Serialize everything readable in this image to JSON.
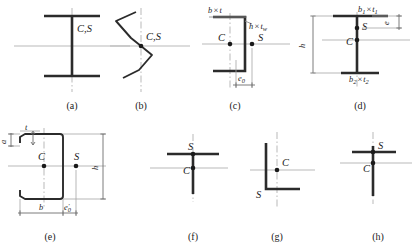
{
  "figure": {
    "point_labels": {
      "centroid": "C",
      "shear_centre": "S",
      "combined": "C,S"
    },
    "symbols": {
      "multiply": "×",
      "prime": "′"
    }
  },
  "panels": [
    {
      "id": "a",
      "caption": "(a)",
      "shape": "doubly-symmetric-i-section",
      "points": [
        {
          "name": "combined",
          "label": "C,S",
          "label_text": "C,S"
        }
      ],
      "dimensions": []
    },
    {
      "id": "b",
      "caption": "(b)",
      "shape": "z-section",
      "points": [
        {
          "name": "combined",
          "label": "C,S",
          "label_text": "C,S"
        }
      ],
      "dimensions": []
    },
    {
      "id": "c",
      "caption": "(c)",
      "shape": "channel-section",
      "points": [
        {
          "name": "centroid",
          "label": "C"
        },
        {
          "name": "shear-centre",
          "label": "S"
        }
      ],
      "dimensions": [
        {
          "name": "flange",
          "base": "b",
          "sep": "×",
          "second": "t",
          "second_sub": ""
        },
        {
          "name": "web",
          "base": "h",
          "sep": "×",
          "second": "t",
          "second_sub": "w"
        },
        {
          "name": "eccentricity",
          "base": "e",
          "base_sub": "0",
          "prime": false
        }
      ]
    },
    {
      "id": "d",
      "caption": "(d)",
      "shape": "mono-symmetric-i-section",
      "points": [
        {
          "name": "shear-centre",
          "label": "S"
        },
        {
          "name": "centroid",
          "label": "C"
        }
      ],
      "dimensions": [
        {
          "name": "top-flange",
          "base": "b",
          "base_sub": "1",
          "sep": "×",
          "second": "t",
          "second_sub": "1"
        },
        {
          "name": "bottom-flange",
          "base": "b",
          "base_sub": "2",
          "sep": "×",
          "second": "t",
          "second_sub": "2"
        },
        {
          "name": "height",
          "base": "h"
        },
        {
          "name": "shear-offset",
          "base": "e",
          "base_sub": ""
        }
      ]
    },
    {
      "id": "e",
      "caption": "(e)",
      "shape": "lipped-channel-section",
      "points": [
        {
          "name": "centroid",
          "label": "C"
        },
        {
          "name": "shear-centre",
          "label": "S"
        }
      ],
      "dimensions": [
        {
          "name": "thickness",
          "base": "t"
        },
        {
          "name": "lip",
          "base": "a"
        },
        {
          "name": "height",
          "base": "h"
        },
        {
          "name": "width",
          "base": "b"
        },
        {
          "name": "eccentricity",
          "base": "e",
          "base_sub": "0",
          "prime": true
        }
      ]
    },
    {
      "id": "f",
      "caption": "(f)",
      "shape": "tee-section",
      "points": [
        {
          "name": "shear-centre",
          "label": "S"
        },
        {
          "name": "centroid",
          "label": "C"
        }
      ],
      "dimensions": []
    },
    {
      "id": "g",
      "caption": "(g)",
      "shape": "angle-section",
      "points": [
        {
          "name": "centroid",
          "label": "C"
        },
        {
          "name": "shear-centre",
          "label": "S"
        }
      ],
      "dimensions": []
    },
    {
      "id": "h",
      "caption": "(h)",
      "shape": "narrow-tee-section",
      "points": [
        {
          "name": "shear-centre",
          "label": "S"
        },
        {
          "name": "centroid",
          "label": "C"
        }
      ],
      "dimensions": []
    }
  ]
}
